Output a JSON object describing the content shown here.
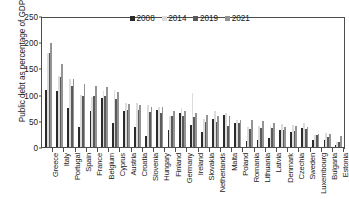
{
  "chart_data": {
    "type": "bar",
    "title": "",
    "xlabel": "",
    "ylabel": "Public debt as percentage of GDP",
    "ylim": [
      0,
      250
    ],
    "yticks": [
      0,
      50,
      100,
      150,
      200,
      250
    ],
    "grid": false,
    "legend_position": "top-center",
    "categories": [
      "Greece",
      "Italy",
      "Portugal",
      "Spain",
      "France",
      "Belgium",
      "Cyprus",
      "Austria",
      "Croatia",
      "Slovenia",
      "Hungary",
      "Finland",
      "Germany",
      "Ireland",
      "Slovakia",
      "Netherlands",
      "Malta",
      "Poland",
      "Romania",
      "Lithuania",
      "Latvia",
      "Denmark",
      "Czechia",
      "Sweden",
      "Luxembourg",
      "Bulgaria",
      "Estonia"
    ],
    "series": [
      {
        "name": "2008",
        "color": "#2b2b2b",
        "values": [
          109,
          106,
          75,
          39,
          68,
          93,
          45,
          68,
          39,
          21,
          71,
          32,
          65,
          42,
          28,
          54,
          62,
          46,
          11,
          14,
          18,
          33,
          28,
          36,
          14,
          13,
          4
        ]
      },
      {
        "name": "2014",
        "color": "#dcdcdc",
        "values": [
          180,
          135,
          130,
          100,
          95,
          107,
          108,
          84,
          84,
          80,
          76,
          60,
          75,
          104,
          54,
          68,
          64,
          51,
          39,
          40,
          41,
          44,
          42,
          45,
          22,
          27,
          10
        ]
      },
      {
        "name": "2019",
        "color": "#5a5a5a",
        "values": [
          180,
          134,
          117,
          98,
          97,
          98,
          91,
          70,
          71,
          66,
          65,
          59,
          59,
          57,
          48,
          48,
          41,
          46,
          35,
          36,
          37,
          33,
          30,
          35,
          22,
          20,
          9
        ]
      },
      {
        "name": "2021",
        "color": "#949494",
        "values": [
          199,
          158,
          130,
          120,
          116,
          115,
          105,
          82,
          80,
          77,
          77,
          68,
          69,
          65,
          61,
          59,
          60,
          52,
          52,
          49,
          46,
          38,
          40,
          39,
          25,
          24,
          21
        ]
      }
    ]
  },
  "legend": {
    "items": [
      {
        "label": "2008",
        "color": "#2b2b2b"
      },
      {
        "label": "2014",
        "color": "#dcdcdc"
      },
      {
        "label": "2019",
        "color": "#5a5a5a"
      },
      {
        "label": "2021",
        "color": "#949494"
      }
    ]
  },
  "axes": {
    "y_title": "Public debt as percentage of GDP",
    "y_tick_labels": [
      "250",
      "200",
      "150",
      "100",
      "50",
      "0"
    ]
  }
}
